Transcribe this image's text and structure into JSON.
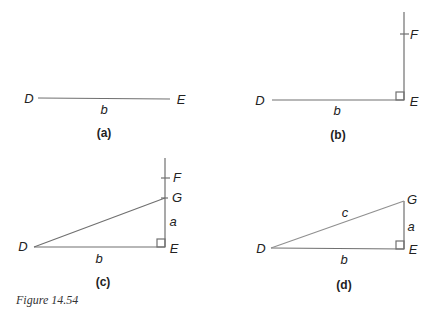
{
  "figure_caption": "Figure 14.54",
  "panels": {
    "a": {
      "caption": "(a)",
      "labels": {
        "D": "D",
        "E": "E",
        "b": "b"
      }
    },
    "b": {
      "caption": "(b)",
      "labels": {
        "D": "D",
        "E": "E",
        "F": "F",
        "b": "b"
      }
    },
    "c": {
      "caption": "(c)",
      "labels": {
        "D": "D",
        "E": "E",
        "F": "F",
        "G": "G",
        "a": "a",
        "b": "b"
      }
    },
    "d": {
      "caption": "(d)",
      "labels": {
        "D": "D",
        "E": "E",
        "G": "G",
        "a": "a",
        "b": "b",
        "c": "c"
      }
    }
  },
  "colors": {
    "line": "#6b6b6b",
    "text": "#222222"
  }
}
